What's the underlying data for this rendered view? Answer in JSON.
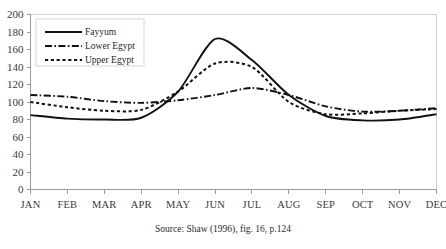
{
  "chart_data": {
    "type": "line",
    "title": "",
    "subtitle": "",
    "xlabel": "",
    "ylabel": "",
    "caption": "Source: Shaw (1996), fig. 16, p.124",
    "categories": [
      "JAN",
      "FEB",
      "MAR",
      "APR",
      "MAY",
      "JUN",
      "JUL",
      "AUG",
      "SEP",
      "OCT",
      "NOV",
      "DEC"
    ],
    "xlim": [
      0,
      11
    ],
    "ylim": [
      0,
      200
    ],
    "y_ticks": [
      0,
      20,
      40,
      60,
      80,
      100,
      120,
      140,
      160,
      180,
      200
    ],
    "grid": false,
    "legend_position": "top-left",
    "series": [
      {
        "name": "Fayyum",
        "style": "solid",
        "color": "#111111",
        "values": [
          85,
          81,
          80,
          82,
          112,
          172,
          148,
          108,
          84,
          79,
          80,
          86
        ]
      },
      {
        "name": "Lower Egypt",
        "style": "dash-dot",
        "color": "#111111",
        "values": [
          108,
          106,
          101,
          99,
          102,
          108,
          116,
          108,
          95,
          89,
          90,
          93
        ]
      },
      {
        "name": "Upper Egypt",
        "style": "dotted",
        "color": "#111111",
        "values": [
          100,
          94,
          90,
          91,
          112,
          144,
          140,
          100,
          86,
          87,
          90,
          92
        ]
      }
    ]
  },
  "legend": {
    "entries": [
      {
        "label": "Fayyum"
      },
      {
        "label": "Lower Egypt"
      },
      {
        "label": "Upper Egypt"
      }
    ]
  },
  "caption": {
    "text": "Source: Shaw (1996), fig. 16, p.124"
  }
}
